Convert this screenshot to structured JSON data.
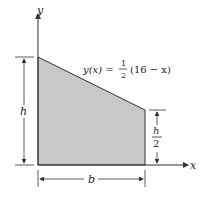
{
  "diagram": {
    "axes": {
      "x_label": "x",
      "y_label": "y"
    },
    "equation": {
      "lhs": "y(x) =",
      "frac_num": "1",
      "frac_den": "2",
      "rhs": "(16 − x)"
    },
    "dimensions": {
      "left_height": "h",
      "right_height_num": "h",
      "right_height_den": "2",
      "base": "b"
    },
    "colors": {
      "fill": "#c8c8c8",
      "stroke": "#333333"
    }
  }
}
